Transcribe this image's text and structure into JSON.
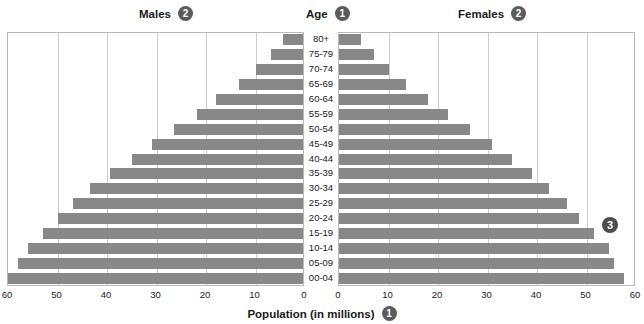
{
  "header": {
    "males_label": "Males",
    "males_badge": "2",
    "age_label": "Age",
    "age_badge": "1",
    "females_label": "Females",
    "females_badge": "2"
  },
  "annotations": {
    "right_badge": "3"
  },
  "footer": {
    "axis_title": "Population (in millions)",
    "axis_badge": "1"
  },
  "style": {
    "bar_color": "#888888",
    "grid_color": "#cccccc",
    "border_color": "#b9b9b9",
    "badge_color": "#4d4d4d",
    "text_color": "#1a1a1a"
  },
  "chart_data": {
    "type": "bar",
    "subtype": "population-pyramid",
    "title": "",
    "xlabel": "Population (in millions)",
    "ylabel": "Age",
    "grid": true,
    "legend_position": "top",
    "xlim": [
      0,
      60
    ],
    "xticks_left": [
      60,
      50,
      40,
      30,
      20,
      10,
      0
    ],
    "xticks_right": [
      0,
      10,
      20,
      30,
      40,
      50,
      60
    ],
    "categories": [
      "80+",
      "75-79",
      "70-74",
      "65-69",
      "60-64",
      "55-59",
      "50-54",
      "45-49",
      "40-44",
      "35-39",
      "30-34",
      "25-29",
      "20-24",
      "15-19",
      "10-14",
      "05-09",
      "00-04"
    ],
    "series": [
      {
        "name": "Males",
        "side": "left",
        "values": [
          4.0,
          6.5,
          9.5,
          13.0,
          17.5,
          21.5,
          26.0,
          30.5,
          34.5,
          39.0,
          43.0,
          46.5,
          49.5,
          52.5,
          55.5,
          57.5,
          60.0
        ]
      },
      {
        "name": "Females",
        "side": "right",
        "values": [
          4.5,
          7.0,
          10.0,
          13.5,
          18.0,
          22.0,
          26.5,
          31.0,
          35.0,
          39.0,
          42.5,
          46.0,
          48.5,
          51.5,
          54.5,
          55.5,
          57.5
        ]
      }
    ]
  }
}
